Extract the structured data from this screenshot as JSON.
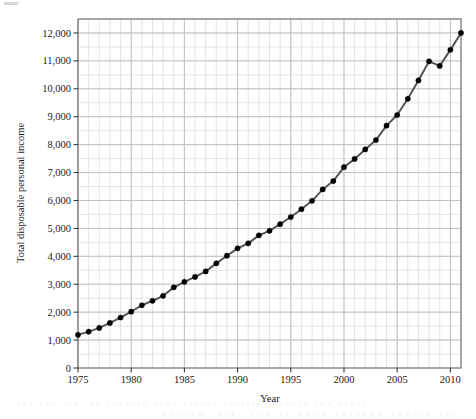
{
  "chart_data": {
    "type": "line",
    "title": "",
    "xlabel": "Year",
    "ylabel": "Total disposable personal income",
    "xlim": [
      1975,
      2011
    ],
    "ylim": [
      0,
      12500
    ],
    "grid": true,
    "grid_minor_x_step": 1,
    "grid_minor_y_step": 500,
    "legend": "none",
    "marker": "filled-circle",
    "line_color": "#555555",
    "marker_color": "#000000",
    "x": [
      1975,
      1976,
      1977,
      1978,
      1979,
      1980,
      1981,
      1982,
      1983,
      1984,
      1985,
      1986,
      1987,
      1988,
      1989,
      1990,
      1991,
      1992,
      1993,
      1994,
      1995,
      1996,
      1997,
      1998,
      1999,
      2000,
      2001,
      2002,
      2003,
      2004,
      2005,
      2006,
      2007,
      2008,
      2009,
      2010,
      2011
    ],
    "values": [
      1187,
      1302,
      1436,
      1614,
      1808,
      2019,
      2248,
      2407,
      2586,
      2888,
      3086,
      3262,
      3460,
      3748,
      4022,
      4286,
      4465,
      4751,
      4912,
      5152,
      5409,
      5688,
      5988,
      6396,
      6695,
      7194,
      7487,
      7830,
      8163,
      8681,
      9062,
      9641,
      10300,
      10983,
      10820,
      11395,
      12000
    ],
    "ytick_labels": [
      "0",
      "1,000",
      "2,000",
      "3,000",
      "4,000",
      "5,000",
      "6,000",
      "7,000",
      "8,000",
      "9,000",
      "10,000",
      "11,000",
      "12,000"
    ],
    "ytick_values": [
      0,
      1000,
      2000,
      3000,
      4000,
      5000,
      6000,
      7000,
      8000,
      9000,
      10000,
      11000,
      12000
    ],
    "xtick_labels": [
      "1975",
      "1980",
      "1985",
      "1990",
      "1995",
      "2000",
      "2005",
      "2010"
    ],
    "xtick_values": [
      1975,
      1980,
      1985,
      1990,
      1995,
      2000,
      2005,
      2010
    ]
  },
  "artifacts": {
    "bleed_line_1": "the text on the reverse page bleeds faintly through the paper",
    "bleed_line_2": "a second faint row of show-through characters"
  }
}
